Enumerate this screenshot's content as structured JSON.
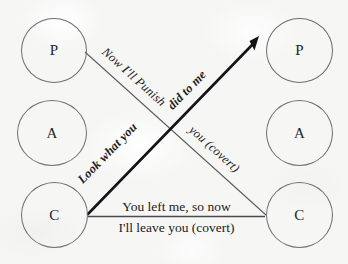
{
  "diagram": {
    "type": "transactional-analysis-ego-state-diagram",
    "background_color": "#f6f6f5",
    "stroke_color": "#6e6e72",
    "text_color": "#1d1d22",
    "left_person": {
      "ego_states": [
        {
          "letter": "P",
          "name": "parent"
        },
        {
          "letter": "A",
          "name": "adult"
        },
        {
          "letter": "C",
          "name": "child"
        }
      ]
    },
    "right_person": {
      "ego_states": [
        {
          "letter": "P",
          "name": "parent"
        },
        {
          "letter": "A",
          "name": "adult"
        },
        {
          "letter": "C",
          "name": "child"
        }
      ]
    },
    "transactions": [
      {
        "id": "parent-to-child-covert",
        "from": "left-parent",
        "to": "right-child",
        "style": "thin",
        "arrowhead": false,
        "label_part_1": "Now I'll Punish",
        "label_part_2": "you (covert)"
      },
      {
        "id": "child-to-parent-overt",
        "from": "left-child",
        "to": "right-parent",
        "style": "bold",
        "arrowhead": true,
        "label_part_1": "Look what you",
        "label_part_2": "did to me"
      },
      {
        "id": "child-to-child-horizontal",
        "from": "left-child",
        "to": "right-child",
        "style": "thin",
        "arrowhead": false,
        "label_above": "You left me, so now",
        "label_below": "I'll leave you (covert)"
      }
    ]
  }
}
